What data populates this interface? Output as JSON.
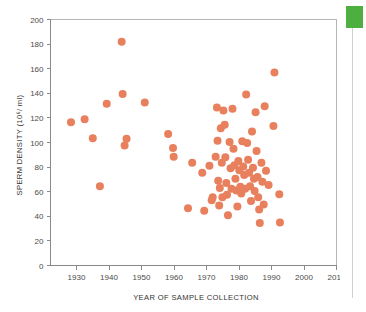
{
  "chart_data": {
    "type": "scatter",
    "title": "",
    "xlabel": "YEAR OF SAMPLE COLLECTION",
    "ylabel": "SPERM DENSITY (10⁶/ ml)",
    "xlim": [
      1922,
      2010
    ],
    "ylim": [
      0,
      200
    ],
    "xticks": [
      1930,
      1940,
      1950,
      1960,
      1970,
      1980,
      1990,
      2000,
      2010
    ],
    "yticks": [
      0,
      20,
      40,
      60,
      80,
      100,
      120,
      140,
      160,
      180,
      200
    ],
    "xtick_labels": [
      "1930",
      "1940",
      "1950",
      "1960",
      "1970",
      "1980",
      "1990",
      "2000",
      "2010"
    ],
    "ytick_labels": [
      "0",
      "20",
      "40",
      "60",
      "80",
      "100",
      "120",
      "140",
      "160",
      "180",
      "200"
    ],
    "grid": false,
    "legend": "none",
    "marker_color": "#e8805e",
    "marker_size": 4,
    "series": [
      {
        "name": "Sperm density samples",
        "points": [
          [
            1928.3,
            116.5
          ],
          [
            1932.5,
            119.0
          ],
          [
            1935.0,
            103.5
          ],
          [
            1937.2,
            64.5
          ],
          [
            1939.3,
            131.5
          ],
          [
            1943.9,
            182.0
          ],
          [
            1944.2,
            139.5
          ],
          [
            1944.8,
            97.5
          ],
          [
            1945.4,
            103.0
          ],
          [
            1951.0,
            132.5
          ],
          [
            1958.2,
            107.0
          ],
          [
            1959.7,
            95.5
          ],
          [
            1959.9,
            88.5
          ],
          [
            1964.3,
            46.5
          ],
          [
            1965.6,
            83.5
          ],
          [
            1968.7,
            75.5
          ],
          [
            1969.3,
            44.5
          ],
          [
            1970.9,
            81.0
          ],
          [
            1971.6,
            53.0
          ],
          [
            1971.9,
            55.5
          ],
          [
            1972.8,
            88.5
          ],
          [
            1973.2,
            128.5
          ],
          [
            1973.4,
            101.5
          ],
          [
            1973.6,
            69.0
          ],
          [
            1973.9,
            48.8
          ],
          [
            1974.1,
            63.0
          ],
          [
            1974.4,
            111.5
          ],
          [
            1974.7,
            83.5
          ],
          [
            1974.9,
            55.5
          ],
          [
            1975.2,
            126.0
          ],
          [
            1975.6,
            114.5
          ],
          [
            1975.8,
            88.0
          ],
          [
            1976.1,
            67.0
          ],
          [
            1976.3,
            57.5
          ],
          [
            1976.6,
            40.8
          ],
          [
            1977.1,
            100.5
          ],
          [
            1977.4,
            79.0
          ],
          [
            1977.7,
            62.5
          ],
          [
            1978.0,
            127.5
          ],
          [
            1978.3,
            95.0
          ],
          [
            1978.6,
            81.5
          ],
          [
            1978.9,
            70.5
          ],
          [
            1979.2,
            61.0
          ],
          [
            1979.5,
            48.0
          ],
          [
            1979.8,
            85.0
          ],
          [
            1980.1,
            77.5
          ],
          [
            1980.4,
            64.0
          ],
          [
            1980.7,
            58.5
          ],
          [
            1981.0,
            101.0
          ],
          [
            1981.3,
            80.5
          ],
          [
            1981.6,
            73.5
          ],
          [
            1981.9,
            62.5
          ],
          [
            1982.2,
            139.0
          ],
          [
            1982.5,
            99.5
          ],
          [
            1982.8,
            86.0
          ],
          [
            1983.1,
            75.5
          ],
          [
            1983.4,
            64.5
          ],
          [
            1983.7,
            52.5
          ],
          [
            1984.0,
            109.0
          ],
          [
            1984.3,
            79.5
          ],
          [
            1984.6,
            70.5
          ],
          [
            1984.8,
            60.5
          ],
          [
            1985.1,
            124.5
          ],
          [
            1985.4,
            93.0
          ],
          [
            1985.7,
            72.0
          ],
          [
            1985.9,
            55.5
          ],
          [
            1986.2,
            45.5
          ],
          [
            1986.4,
            34.5
          ],
          [
            1986.9,
            83.5
          ],
          [
            1987.2,
            68.0
          ],
          [
            1987.6,
            49.5
          ],
          [
            1987.9,
            129.5
          ],
          [
            1988.3,
            77.0
          ],
          [
            1989.1,
            65.5
          ],
          [
            1990.6,
            113.5
          ],
          [
            1990.9,
            157.0
          ],
          [
            1992.4,
            58.0
          ],
          [
            1992.6,
            35.0
          ]
        ]
      }
    ]
  },
  "side_panel": {
    "marker_color": "#4caf3f",
    "marker_name": "green-tab-marker"
  }
}
